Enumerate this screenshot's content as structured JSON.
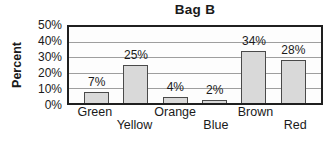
{
  "chart_data": {
    "type": "bar",
    "title": "Bag B",
    "xlabel": "",
    "ylabel": "Percent",
    "categories": [
      "Green",
      "Yellow",
      "Orange",
      "Blue",
      "Brown",
      "Red"
    ],
    "values": [
      7,
      25,
      4,
      2,
      34,
      28
    ],
    "value_labels": [
      "7%",
      "25%",
      "4%",
      "2%",
      "34%",
      "28%"
    ],
    "ylim": [
      0,
      50
    ],
    "yticks": [
      {
        "label": "0%",
        "value": 0
      },
      {
        "label": "10%",
        "value": 10
      },
      {
        "label": "20%",
        "value": 20
      },
      {
        "label": "30%",
        "value": 30
      },
      {
        "label": "40%",
        "value": 40
      },
      {
        "label": "50%",
        "value": 50
      }
    ],
    "grid": "horizontal",
    "legend": "none",
    "x_label_layout": "staggered-two-rows"
  },
  "colors": {
    "background": "#ffffff",
    "text": "#1a1a1a",
    "bar_fill": "#d9d9d9",
    "bar_border": "#4a4a4a",
    "gridline": "#9e9e9e",
    "plot_border": "#1f1f1f"
  }
}
